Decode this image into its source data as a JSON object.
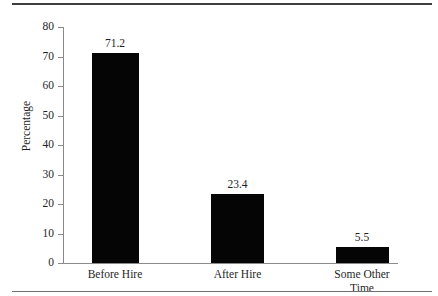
{
  "chart_data": {
    "type": "bar",
    "title": "",
    "xlabel": "",
    "ylabel": "Percentage",
    "categories": [
      "Before Hire",
      "After Hire",
      "Some Other Time"
    ],
    "values": [
      71.2,
      23.4,
      5.5
    ],
    "value_labels": [
      "71.2",
      "23.4",
      "5.5"
    ],
    "ylim": [
      0,
      80
    ],
    "yticks": [
      0,
      10,
      20,
      30,
      40,
      50,
      60,
      70,
      80
    ],
    "ytick_labels": [
      "0",
      "10",
      "20",
      "30",
      "40",
      "50",
      "60",
      "70",
      "80"
    ],
    "grid": false,
    "legend": false,
    "bar_color": "#050505",
    "axis_color": "#8a8a8a",
    "text_color": "#1f1f1f"
  },
  "figure": {
    "top_rule": "",
    "bottom_rule": ""
  },
  "category_lines": [
    [
      "Before Hire"
    ],
    [
      "After Hire"
    ],
    [
      "Some Other",
      "Time"
    ]
  ]
}
